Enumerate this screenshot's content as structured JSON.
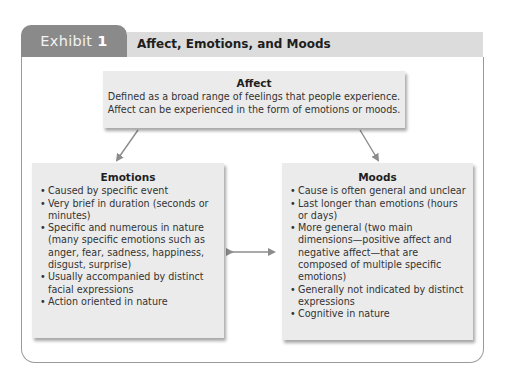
{
  "header": {
    "exhibit_label": "Exhibit",
    "exhibit_number": "1",
    "title": "Affect, Emotions, and Moods"
  },
  "affect": {
    "title": "Affect",
    "description_line1": "Defined as a broad range of feelings that people experience.",
    "description_line2": "Affect can be experienced in the form of emotions or moods."
  },
  "emotions": {
    "title": "Emotions",
    "items": [
      "Caused by specific event",
      "Very brief in duration (seconds or minutes)",
      "Specific and numerous in nature (many specific emotions such as anger, fear, sadness, happiness, disgust, surprise)",
      "Usually accompanied by distinct facial expressions",
      "Action oriented in nature"
    ]
  },
  "moods": {
    "title": "Moods",
    "items": [
      "Cause is often general and unclear",
      "Last longer than emotions (hours or days)",
      "More general (two main dimensions—positive affect and negative affect—that are composed of multiple specific emotions)",
      "Generally not indicated by distinct expressions",
      "Cognitive in nature"
    ]
  },
  "colors": {
    "tab": "#8a8a8a",
    "header_band": "#dcdcdc",
    "box_fill": "#ebebeb",
    "arrow": "#8c8c8c",
    "frame_border": "#9a9a9a"
  }
}
